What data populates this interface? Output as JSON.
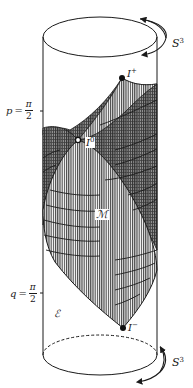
{
  "figure": {
    "type": "penrose-diagram-cylinder",
    "colors": {
      "line": "#1a1a1a",
      "hatch": "#2a2a2a",
      "background": "#ffffff"
    }
  },
  "labels": {
    "s3_top": "S",
    "s3_top_sup": "3",
    "s3_bottom": "S",
    "s3_bottom_sup": "3",
    "i_plus": "I",
    "i_plus_sup": "+",
    "i_zero": "I",
    "i_zero_sup": "0",
    "i_minus": "I",
    "i_minus_sup": "−",
    "region_M": "ℳ",
    "region_E": "ℰ",
    "p_label": {
      "var": "p",
      "eq": "=",
      "num": "π",
      "den": "2"
    },
    "q_label": {
      "var": "q",
      "eq": "=",
      "num": "π",
      "den": "2"
    }
  }
}
